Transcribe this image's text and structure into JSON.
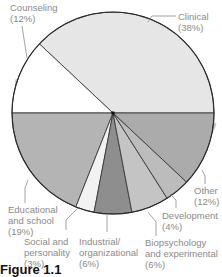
{
  "chart_data": {
    "type": "pie",
    "title": "",
    "caption": "Figure 1.1",
    "unit": "%",
    "slices": [
      {
        "label": "Clinical",
        "value": 38,
        "display": "(38%)",
        "color": "#e6e6e6"
      },
      {
        "label": "Counseling",
        "value": 12,
        "display": "(12%)",
        "color": "#ffffff"
      },
      {
        "label": "Educational and school",
        "value": 19,
        "display": "(19%)",
        "color": "#b4b4b4"
      },
      {
        "label": "Social and personality",
        "value": 3,
        "display": "(3%)",
        "color": "#f2f2f2"
      },
      {
        "label": "Industrial/ organizational",
        "value": 6,
        "display": "(6%)",
        "color": "#8e8e8e"
      },
      {
        "label": "Biopsychology and experimental",
        "value": 6,
        "display": "(6%)",
        "color": "#c4c4c4"
      },
      {
        "label": "Development",
        "value": 4,
        "display": "(4%)",
        "color": "#bcbcbc"
      },
      {
        "label": "Other",
        "value": 12,
        "display": "(12%)",
        "color": "#ababab"
      }
    ],
    "start_angle_deg": 0,
    "direction": "counterclockwise",
    "legend": "none (direct leader-line labels)"
  },
  "labels": {
    "clinical": [
      "Clinical",
      "(38%)"
    ],
    "counseling": [
      "Counseling",
      "(12%)"
    ],
    "educational": [
      "Educational",
      "and school",
      "(19%)"
    ],
    "social": [
      "Social and",
      "personality",
      "(3%)"
    ],
    "industrial": [
      "Industrial/",
      "organizational",
      "(6%)"
    ],
    "bio": [
      "Biopsychology",
      "and experimental",
      "(6%)"
    ],
    "development": [
      "Development",
      "(4%)"
    ],
    "other": [
      "Other",
      "(12%)"
    ]
  },
  "caption": "Figure 1.1"
}
